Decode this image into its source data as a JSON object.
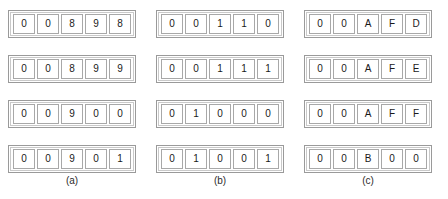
{
  "figure": {
    "background_color": "#ffffff",
    "frame_color": "#9a9a9a",
    "cell_border_color": "#a8a8a8",
    "text_color": "#1a1a1a"
  },
  "groups": [
    {
      "id": "group-a",
      "caption": "(a)",
      "rows": [
        {
          "cells": [
            "0",
            "0",
            "8",
            "9",
            "8"
          ]
        },
        {
          "cells": [
            "0",
            "0",
            "8",
            "9",
            "9"
          ]
        },
        {
          "cells": [
            "0",
            "0",
            "9",
            "0",
            "0"
          ]
        },
        {
          "cells": [
            "0",
            "0",
            "9",
            "0",
            "1"
          ]
        }
      ]
    },
    {
      "id": "group-b",
      "caption": "(b)",
      "rows": [
        {
          "cells": [
            "0",
            "0",
            "1",
            "1",
            "0"
          ]
        },
        {
          "cells": [
            "0",
            "0",
            "1",
            "1",
            "1"
          ]
        },
        {
          "cells": [
            "0",
            "1",
            "0",
            "0",
            "0"
          ]
        },
        {
          "cells": [
            "0",
            "1",
            "0",
            "0",
            "1"
          ]
        }
      ]
    },
    {
      "id": "group-c",
      "caption": "(c)",
      "rows": [
        {
          "cells": [
            "0",
            "0",
            "A",
            "F",
            "D"
          ]
        },
        {
          "cells": [
            "0",
            "0",
            "A",
            "F",
            "E"
          ]
        },
        {
          "cells": [
            "0",
            "0",
            "A",
            "F",
            "F"
          ]
        },
        {
          "cells": [
            "0",
            "0",
            "B",
            "0",
            "0"
          ]
        }
      ]
    }
  ]
}
